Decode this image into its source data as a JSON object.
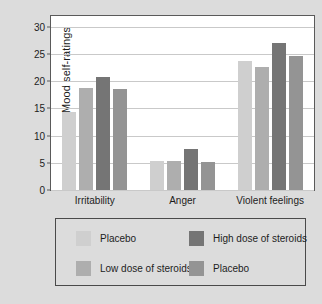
{
  "chart_data": {
    "type": "bar",
    "title": "",
    "subtitle": "",
    "xlabel": "",
    "ylabel": "Mood self-ratings",
    "categories": [
      "Irritability",
      "Anger",
      "Violent feelings"
    ],
    "series": [
      {
        "name": "Placebo",
        "color": "#cfcfcf",
        "values": [
          14.4,
          5.4,
          23.7
        ]
      },
      {
        "name": "Low dose of steroids",
        "color": "#aeaeae",
        "values": [
          18.8,
          5.3,
          22.7
        ]
      },
      {
        "name": "High dose of steroids",
        "color": "#757575",
        "values": [
          20.8,
          7.5,
          27.0
        ]
      },
      {
        "name": "Placebo",
        "color": "#949494",
        "values": [
          18.5,
          5.2,
          24.6
        ]
      }
    ],
    "ylim": [
      0,
      32
    ],
    "yticks": [
      0,
      5,
      10,
      15,
      20,
      25,
      30
    ],
    "ytick_labels": [
      "0",
      "5",
      "10",
      "15",
      "20",
      "25",
      "30"
    ],
    "grid": true,
    "grid_axis": "y",
    "legend_position": "below",
    "legend": [
      {
        "label": "Placebo",
        "color": "#cfcfcf"
      },
      {
        "label": "High dose of steroids",
        "color": "#757575"
      },
      {
        "label": "Low dose of steroids",
        "color": "#aeaeae"
      },
      {
        "label": "Placebo",
        "color": "#949494"
      }
    ]
  },
  "colors": {
    "background": "#dcdcdc",
    "plot_area": "#ffffff",
    "axis": "#5a5a5a",
    "gridline": "#c9c9c9",
    "text": "#1c1c1c"
  }
}
